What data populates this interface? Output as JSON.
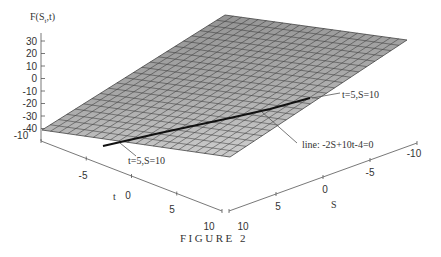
{
  "chart_data": {
    "type": "surface3d",
    "title": "",
    "caption": "FIGURE 2",
    "zlabel": "F(S_t,t)",
    "zlabel_main": "F(S",
    "zlabel_sub": "t",
    "zlabel_tail": ",t)",
    "xlabel": "t",
    "ylabel": "S",
    "z_ticks": [
      "30",
      "20",
      "10",
      "0",
      "-10",
      "-20",
      "-30",
      "-40"
    ],
    "t_ticks": [
      "-10",
      "-5",
      "0",
      "5",
      "10"
    ],
    "s_ticks": [
      "10",
      "5",
      "0",
      "-5",
      "-10"
    ],
    "t_range": [
      -10,
      10
    ],
    "s_range": [
      -10,
      10
    ],
    "z_range": [
      -40,
      30
    ],
    "surface": "plane F = -2S + 10t - 4 shown as gray meshed surface",
    "annotations": [
      {
        "text": "t=5,S=10",
        "target": "upper end of line"
      },
      {
        "text": "t=5,S=10",
        "target": "lower end of line"
      },
      {
        "text": "line: -2S+10t-4=0",
        "target": "black line on surface"
      }
    ],
    "grid": true,
    "legend": "none"
  },
  "labels": {
    "ann_top": "t=5,S=10",
    "ann_bottom": "t=5,S=10",
    "ann_line": "line: -2S+10t-4=0"
  },
  "colors": {
    "surface_fill": "#a8a8a8",
    "mesh": "#3a3a3a",
    "axis": "#555555",
    "line": "#111111"
  }
}
